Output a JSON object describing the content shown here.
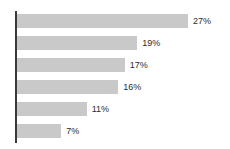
{
  "chart_data": {
    "type": "bar",
    "orientation": "horizontal",
    "title": "",
    "subtitle": "",
    "xlabel": "",
    "ylabel": "",
    "grid": false,
    "legend": null,
    "axis": {
      "value_axis": "x",
      "xlim": [
        0,
        30
      ],
      "tick_labels": [],
      "category_labels": []
    },
    "colors": {
      "bar_fill": "#c9c9c9",
      "axis_line": "#3a3a3a",
      "label_text": "#2b2b2b",
      "background": "#ffffff"
    },
    "categories": [
      "",
      "",
      "",
      "",
      "",
      ""
    ],
    "values": [
      27,
      19,
      17,
      16,
      11,
      7
    ],
    "bars": [
      {
        "value": 27,
        "label": "27%"
      },
      {
        "value": 19,
        "label": "19%"
      },
      {
        "value": 17,
        "label": "17%"
      },
      {
        "value": 16,
        "label": "16%"
      },
      {
        "value": 11,
        "label": "11%"
      },
      {
        "value": 7,
        "label": "7%"
      }
    ]
  }
}
